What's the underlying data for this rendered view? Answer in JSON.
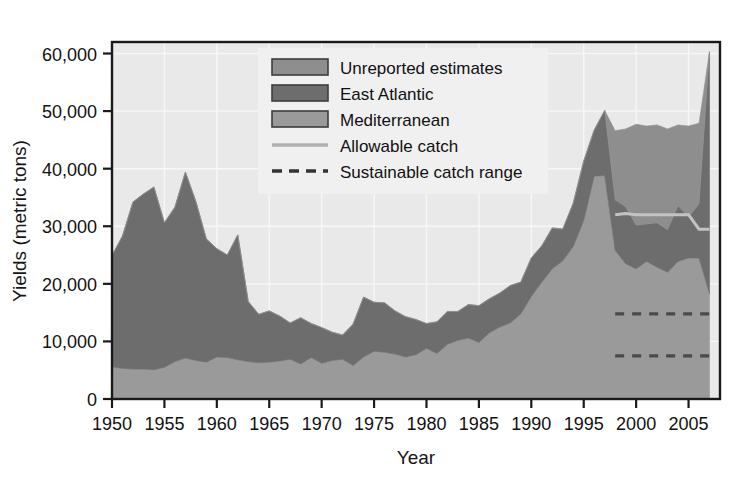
{
  "chart_data": {
    "type": "area",
    "stacked": true,
    "title": "",
    "xlabel": "Year",
    "ylabel": "Yields (metric tons)",
    "xlim": [
      1950,
      2008
    ],
    "ylim": [
      0,
      62000
    ],
    "xticks": [
      1950,
      1955,
      1960,
      1965,
      1970,
      1975,
      1980,
      1985,
      1990,
      1995,
      2000,
      2005
    ],
    "xtick_labels": [
      "1950",
      "1955",
      "1960",
      "1965",
      "1970",
      "1975",
      "1980",
      "1985",
      "1990",
      "1995",
      "2000",
      "2005"
    ],
    "yticks": [
      0,
      10000,
      20000,
      30000,
      40000,
      50000,
      60000
    ],
    "ytick_labels": [
      "0",
      "10,000",
      "20,000",
      "30,000",
      "40,000",
      "50,000",
      "60,000"
    ],
    "grid": true,
    "legend_position": "top-center-right",
    "x": [
      1950,
      1951,
      1952,
      1953,
      1954,
      1955,
      1956,
      1957,
      1958,
      1959,
      1960,
      1961,
      1962,
      1963,
      1964,
      1965,
      1966,
      1967,
      1968,
      1969,
      1970,
      1971,
      1972,
      1973,
      1974,
      1975,
      1976,
      1977,
      1978,
      1979,
      1980,
      1981,
      1982,
      1983,
      1984,
      1985,
      1986,
      1987,
      1988,
      1989,
      1990,
      1991,
      1992,
      1993,
      1994,
      1995,
      1996,
      1997,
      1998,
      1999,
      2000,
      2001,
      2002,
      2003,
      2004,
      2005,
      2006,
      2007
    ],
    "series": [
      {
        "name": "Mediterranean",
        "color": "#9a9a9a",
        "values": [
          5600,
          5300,
          5200,
          5200,
          5100,
          5500,
          6500,
          7100,
          6700,
          6400,
          7300,
          7200,
          6800,
          6500,
          6300,
          6400,
          6600,
          6900,
          6100,
          7200,
          6200,
          6700,
          6900,
          5800,
          7300,
          8300,
          8100,
          7800,
          7300,
          7700,
          8800,
          7900,
          9500,
          10200,
          10600,
          9800,
          11500,
          12500,
          13200,
          14800,
          17800,
          20300,
          22600,
          24000,
          26500,
          31000,
          38700,
          38800,
          25800,
          23500,
          22600,
          23900,
          22900,
          22000,
          23900,
          24500,
          24500,
          18300
        ]
      },
      {
        "name": "East Atlantic",
        "color": "#6d6d6d",
        "values": [
          19300,
          23000,
          29000,
          30400,
          31700,
          25100,
          26800,
          32300,
          27600,
          21400,
          18800,
          17800,
          21700,
          10400,
          8400,
          8900,
          7800,
          6300,
          8000,
          5900,
          6200,
          4900,
          4200,
          7200,
          10400,
          8500,
          8600,
          7500,
          7000,
          6100,
          4300,
          5500,
          5700,
          5000,
          5800,
          6400,
          5900,
          5900,
          6500,
          5500,
          6700,
          6300,
          7100,
          5500,
          7500,
          10300,
          8000,
          11300,
          8800,
          9900,
          7600,
          6500,
          7700,
          7400,
          9700,
          7100,
          9400,
          42000
        ]
      },
      {
        "name": "Unreported estimates",
        "color": "#8e8e8e",
        "values": [
          0,
          0,
          0,
          0,
          0,
          0,
          0,
          0,
          0,
          0,
          0,
          0,
          0,
          0,
          0,
          0,
          0,
          0,
          0,
          0,
          0,
          0,
          0,
          0,
          0,
          0,
          0,
          0,
          0,
          0,
          0,
          0,
          0,
          0,
          0,
          0,
          0,
          0,
          0,
          0,
          0,
          0,
          0,
          0,
          0,
          0,
          0,
          0,
          12000,
          13500,
          17500,
          17000,
          17000,
          17500,
          14000,
          15800,
          14000,
          0
        ]
      }
    ],
    "lines": [
      {
        "name": "Allowable catch",
        "color": "#c3c3c3",
        "style": "solid",
        "x": [
          1998,
          1999,
          2000,
          2001,
          2002,
          2003,
          2004,
          2005,
          2006,
          2007
        ],
        "values": [
          32000,
          32200,
          32000,
          32000,
          32000,
          32000,
          32000,
          32000,
          29500,
          29500
        ]
      },
      {
        "name": "Sustainable catch range upper",
        "color": "#4a4a4a",
        "style": "dashed",
        "x": [
          1998,
          2007
        ],
        "values": [
          14800,
          14800
        ]
      },
      {
        "name": "Sustainable catch range lower",
        "color": "#4a4a4a",
        "style": "dashed",
        "x": [
          1998,
          2007
        ],
        "values": [
          7500,
          7500
        ]
      }
    ],
    "legend": [
      {
        "label": "Unreported estimates",
        "type": "swatch",
        "color": "#8e8e8e"
      },
      {
        "label": "East Atlantic",
        "type": "swatch",
        "color": "#6d6d6d"
      },
      {
        "label": "Mediterranean",
        "type": "swatch",
        "color": "#9a9a9a"
      },
      {
        "label": "Allowable catch",
        "type": "line",
        "color": "#b0b0b0"
      },
      {
        "label": "Sustainable catch range",
        "type": "dashed",
        "color": "#333333"
      }
    ]
  },
  "figure": {
    "background": "#ffffff",
    "plot_background": "#e9e9e9",
    "grid_color": "#f7f7f7",
    "axis_color": "#1a1a1a",
    "legend_background": "#f0f0f0"
  }
}
